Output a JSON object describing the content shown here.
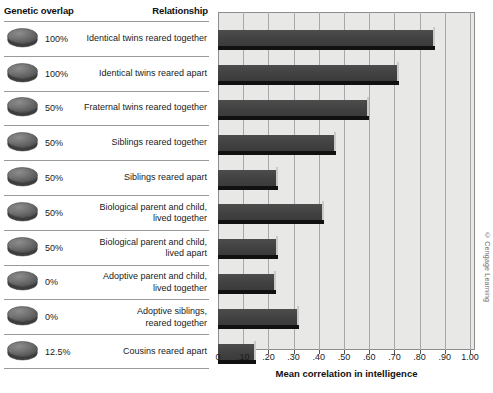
{
  "table": {
    "header_genetic": "Genetic overlap",
    "header_relationship": "Relationship",
    "rows": [
      {
        "genetic": "100%",
        "relationship": "Identical twins reared together"
      },
      {
        "genetic": "100%",
        "relationship": "Identical twins reared apart"
      },
      {
        "genetic": "50%",
        "relationship": "Fraternal twins reared together"
      },
      {
        "genetic": "50%",
        "relationship": "Siblings reared together"
      },
      {
        "genetic": "50%",
        "relationship": "Siblings reared apart"
      },
      {
        "genetic": "50%",
        "relationship": "Biological parent and child,\nlived together"
      },
      {
        "genetic": "50%",
        "relationship": "Biological parent and child,\nlived apart"
      },
      {
        "genetic": "0%",
        "relationship": "Adoptive parent and child,\nlived together"
      },
      {
        "genetic": "0%",
        "relationship": "Adoptive siblings,\nreared together"
      },
      {
        "genetic": "12.5%",
        "relationship": "Cousins reared apart"
      }
    ]
  },
  "credit": "© Cengage Learning",
  "colors": {
    "bar": "#414141",
    "plot_background": "#e8e8e6",
    "gridline": "#a8a8a8",
    "rule": "#9a9a9a",
    "text": "#1a1a1a"
  },
  "chart_data": {
    "type": "bar",
    "orientation": "horizontal",
    "title": "",
    "xlabel": "Mean correlation in intelligence",
    "ylabel": "",
    "xlim": [
      0,
      1.0
    ],
    "grid": true,
    "legend": false,
    "tick_labels": [
      "0",
      ".10",
      ".20",
      ".30",
      ".40",
      ".50",
      ".60",
      ".70",
      ".80",
      ".90",
      "1.00"
    ],
    "ticks": [
      0,
      0.1,
      0.2,
      0.3,
      0.4,
      0.5,
      0.6,
      0.7,
      0.8,
      0.9,
      1.0
    ],
    "categories": [
      "Identical twins reared together",
      "Identical twins reared apart",
      "Fraternal twins reared together",
      "Siblings reared together",
      "Siblings reared apart",
      "Biological parent and child, lived together",
      "Biological parent and child, lived apart",
      "Adoptive parent and child, lived together",
      "Adoptive siblings, reared together",
      "Cousins reared apart"
    ],
    "values": [
      0.86,
      0.72,
      0.6,
      0.47,
      0.24,
      0.42,
      0.24,
      0.23,
      0.32,
      0.15
    ],
    "genetic_overlap": [
      "100%",
      "100%",
      "50%",
      "50%",
      "50%",
      "50%",
      "50%",
      "0%",
      "0%",
      "12.5%"
    ]
  }
}
